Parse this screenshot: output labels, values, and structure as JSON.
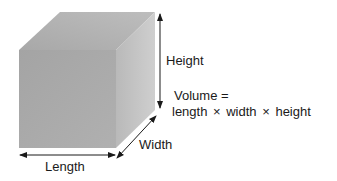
{
  "diagram": {
    "labels": {
      "height": "Height",
      "width": "Width",
      "length": "Length"
    },
    "formula": {
      "line1": "Volume =",
      "line2": "length × width × height"
    },
    "colors": {
      "front_face": "#a9a9a9",
      "top_face": "#b3b3b3",
      "side_face": "#c2c2c2",
      "arrow": "#1a1a1a"
    }
  }
}
